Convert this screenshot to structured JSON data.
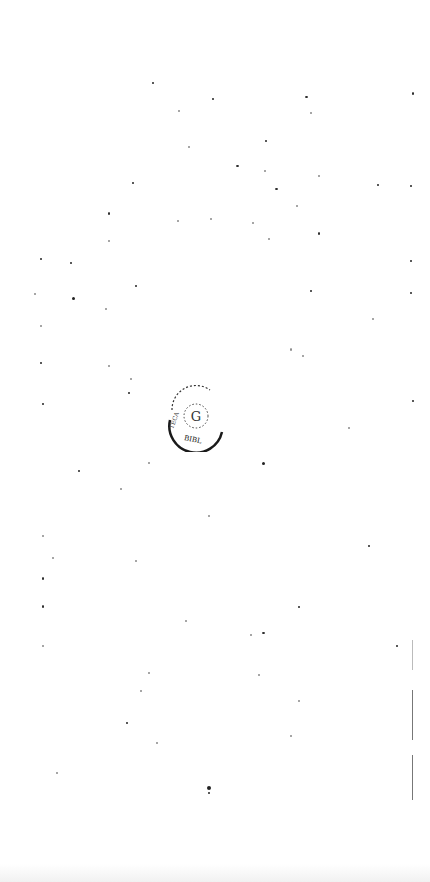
{
  "page": {
    "type": "blank scanned page",
    "stamp": {
      "shape": "circular library stamp",
      "legible_text": "BIBLIOTECA",
      "color": "#1a1a1a"
    },
    "page_edge": {
      "visible": true,
      "side": "right"
    }
  }
}
